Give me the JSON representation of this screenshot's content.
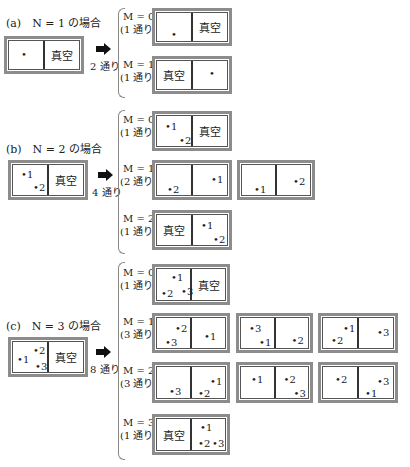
{
  "vacuum_label": "真空",
  "sections": [
    {
      "id": "a",
      "caption": "(a)　N = 1 の場合",
      "initial": {
        "left": [
          {
            "n": ""
          }
        ],
        "right": "vacuum"
      },
      "ways": "2 通り",
      "rows": [
        {
          "m": "M = 0",
          "count": "(1 通り)"
        },
        {
          "m": "M = 1",
          "count": "(1 通り)"
        }
      ]
    },
    {
      "id": "b",
      "caption": "(b)　N = 2 の場合",
      "ways": "4 通り",
      "rows": [
        {
          "m": "M = 0",
          "count": "(1 通り)"
        },
        {
          "m": "M = 1",
          "count": "(2 通り)"
        },
        {
          "m": "M = 2",
          "count": "(1 通り)"
        }
      ]
    },
    {
      "id": "c",
      "caption": "(c)　N = 3 の場合",
      "ways": "8 通り",
      "rows": [
        {
          "m": "M = 0",
          "count": "(1 通り)"
        },
        {
          "m": "M = 1",
          "count": "(3 通り)"
        },
        {
          "m": "M = 2",
          "count": "(3 通り)"
        },
        {
          "m": "M = 3",
          "count": "(1 通り)"
        }
      ]
    }
  ],
  "particles": {
    "p1": "1",
    "p2": "2",
    "p3": "3"
  }
}
